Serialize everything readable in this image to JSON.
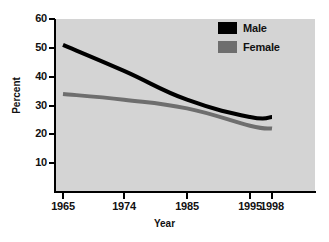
{
  "chart_data": {
    "type": "line",
    "title": "",
    "xlabel": "Year",
    "ylabel": "Percent",
    "x": [
      1965,
      1974,
      1985,
      1995,
      1998
    ],
    "xtick_labels": [
      "1965",
      "1974",
      "1985",
      "1995",
      "1998"
    ],
    "ytick_labels": [
      "60",
      "50",
      "40",
      "30",
      "20",
      "10"
    ],
    "ytick_values": [
      60,
      50,
      40,
      30,
      20,
      10
    ],
    "ylim": [
      0,
      60
    ],
    "xlim": [
      1962,
      2000
    ],
    "grid": false,
    "legend_position": "top-right",
    "series": [
      {
        "name": "Male",
        "color": "#000000",
        "values": [
          51,
          42,
          32,
          26,
          26
        ]
      },
      {
        "name": "Female",
        "color": "#6e6e6e",
        "values": [
          34,
          32,
          29,
          23,
          22
        ]
      }
    ]
  },
  "axes": {
    "y_title": "Percent",
    "x_title": "Year"
  },
  "legend": {
    "items": [
      {
        "label": "Male",
        "color": "#000000"
      },
      {
        "label": "Female",
        "color": "#6e6e6e"
      }
    ]
  },
  "colors": {
    "plot_background": "#d4d4d4",
    "page_background": "#ffffff",
    "axis": "#000000",
    "male": "#000000",
    "female": "#6e6e6e"
  }
}
